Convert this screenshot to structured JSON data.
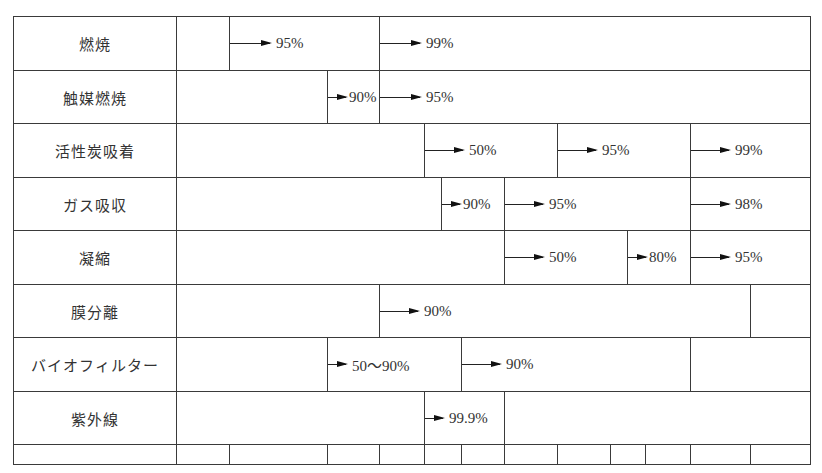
{
  "table": {
    "origin": {
      "x": 13,
      "y": 16
    },
    "right_edge": 810,
    "label_col_right": 176,
    "row_bounds": [
      16,
      70,
      123,
      177,
      230,
      284,
      337,
      391,
      444,
      464
    ],
    "rows": [
      {
        "label": "燃焼",
        "segments": [
          {
            "x0": 176,
            "x1": 229,
            "text": ""
          },
          {
            "x0": 229,
            "x1": 379,
            "text": "95%",
            "arrow": true,
            "arrow_len": 42
          },
          {
            "x0": 379,
            "x1": 810,
            "text": "99%",
            "arrow": true,
            "arrow_len": 42
          }
        ]
      },
      {
        "label": "触媒燃焼",
        "segments": [
          {
            "x0": 176,
            "x1": 327,
            "text": ""
          },
          {
            "x0": 327,
            "x1": 379,
            "text": "90%",
            "arrow": true,
            "arrow_len": 20,
            "tight": true
          },
          {
            "x0": 379,
            "x1": 810,
            "text": "95%",
            "arrow": true,
            "arrow_len": 42
          }
        ]
      },
      {
        "label": "活性炭吸着",
        "segments": [
          {
            "x0": 176,
            "x1": 424,
            "text": ""
          },
          {
            "x0": 424,
            "x1": 557,
            "text": "50%",
            "arrow": true,
            "arrow_len": 40
          },
          {
            "x0": 557,
            "x1": 690,
            "text": "95%",
            "arrow": true,
            "arrow_len": 40
          },
          {
            "x0": 690,
            "x1": 810,
            "text": "99%",
            "arrow": true,
            "arrow_len": 40
          }
        ]
      },
      {
        "label": "ガス吸収",
        "segments": [
          {
            "x0": 176,
            "x1": 441,
            "text": ""
          },
          {
            "x0": 441,
            "x1": 504,
            "text": "90%",
            "arrow": true,
            "arrow_len": 20,
            "tight": true
          },
          {
            "x0": 504,
            "x1": 690,
            "text": "95%",
            "arrow": true,
            "arrow_len": 40
          },
          {
            "x0": 690,
            "x1": 810,
            "text": "98%",
            "arrow": true,
            "arrow_len": 40
          }
        ]
      },
      {
        "label": "凝縮",
        "segments": [
          {
            "x0": 176,
            "x1": 504,
            "text": ""
          },
          {
            "x0": 504,
            "x1": 627,
            "text": "50%",
            "arrow": true,
            "arrow_len": 40
          },
          {
            "x0": 627,
            "x1": 690,
            "text": "80%",
            "arrow": true,
            "arrow_len": 20,
            "tight": true
          },
          {
            "x0": 690,
            "x1": 810,
            "text": "95%",
            "arrow": true,
            "arrow_len": 40
          }
        ]
      },
      {
        "label": "膜分離",
        "segments": [
          {
            "x0": 176,
            "x1": 379,
            "text": ""
          },
          {
            "x0": 379,
            "x1": 750,
            "text": "90%",
            "arrow": true,
            "arrow_len": 40
          },
          {
            "x0": 750,
            "x1": 810,
            "text": ""
          }
        ]
      },
      {
        "label": "バイオフィルター",
        "segments": [
          {
            "x0": 176,
            "x1": 327,
            "text": ""
          },
          {
            "x0": 327,
            "x1": 461,
            "text": "50～90%",
            "arrow": true,
            "arrow_len": 20
          },
          {
            "x0": 461,
            "x1": 690,
            "text": "90%",
            "arrow": true,
            "arrow_len": 40
          },
          {
            "x0": 690,
            "x1": 810,
            "text": ""
          }
        ]
      },
      {
        "label": "紫外線",
        "segments": [
          {
            "x0": 176,
            "x1": 424,
            "text": ""
          },
          {
            "x0": 424,
            "x1": 504,
            "text": "99.9%",
            "arrow": true,
            "arrow_len": 20
          },
          {
            "x0": 504,
            "x1": 810,
            "text": ""
          }
        ]
      }
    ],
    "axis_row": {
      "label": "",
      "ticks": [
        176,
        229,
        327,
        379,
        424,
        461,
        504,
        557,
        610,
        645,
        690,
        750,
        810
      ]
    }
  },
  "colors": {
    "line": "#3a3a3a",
    "text": "#333333",
    "arrow": "#111111",
    "background": "#ffffff"
  }
}
